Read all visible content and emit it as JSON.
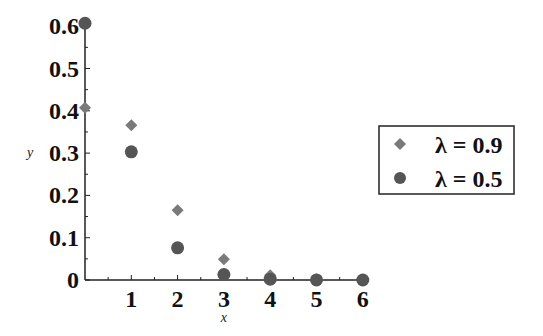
{
  "chart_data": {
    "type": "scatter",
    "title": "",
    "xlabel": "x",
    "ylabel": "y",
    "xlim": [
      0,
      6
    ],
    "ylim": [
      0,
      0.6
    ],
    "x_ticks": [
      "1",
      "2",
      "3",
      "4",
      "5",
      "6"
    ],
    "y_ticks": [
      "0",
      "0.1",
      "0.2",
      "0.3",
      "0.4",
      "0.5",
      "0.6"
    ],
    "grid": false,
    "legend_position": "right",
    "x": [
      0,
      1,
      2,
      3,
      4,
      5,
      6
    ],
    "series": [
      {
        "name": "λ = 0.9",
        "marker": "diamond",
        "color": "#7a7a7a",
        "values": [
          0.407,
          0.366,
          0.165,
          0.049,
          0.011,
          0.002,
          0.0003
        ]
      },
      {
        "name": "λ = 0.5",
        "marker": "circle",
        "color": "#555555",
        "values": [
          0.607,
          0.303,
          0.076,
          0.013,
          0.002,
          0.0002,
          0.0
        ]
      }
    ]
  },
  "legend": {
    "items": [
      {
        "label": "λ = 0.9",
        "marker": "diamond"
      },
      {
        "label": "λ = 0.5",
        "marker": "circle"
      }
    ]
  }
}
